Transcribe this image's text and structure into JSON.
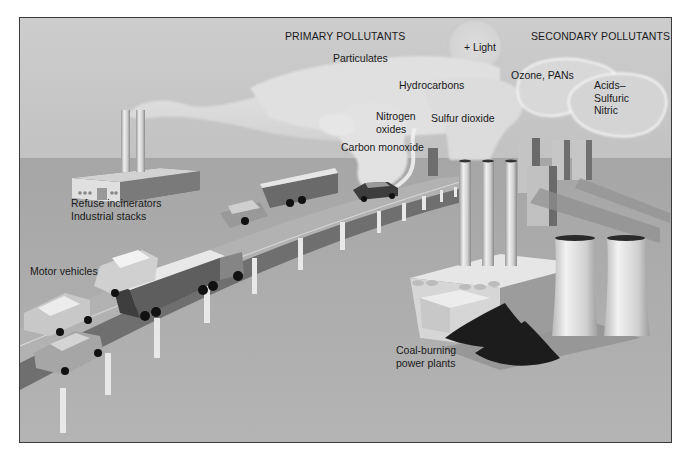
{
  "figure": {
    "type": "illustration",
    "colors": {
      "sky": "#c8c8c8",
      "ground": "#a9a9a9",
      "cloud": "#e2e2e2",
      "road": "#8e8e8e",
      "coal": "#1c1c1c",
      "frame_border": "#3a3a3a"
    }
  },
  "headings": {
    "primary": "PRIMARY POLLUTANTS",
    "secondary": "SECONDARY POLLUTANTS"
  },
  "pollutants": {
    "light": "+ Light",
    "particulates": "Particulates",
    "hydrocarbons": "Hydrocarbons",
    "nitrogen_oxides": "Nitrogen\noxides",
    "sulfur_dioxide": "Sulfur dioxide",
    "carbon_monoxide": "Carbon monoxide",
    "ozone_pans": "Ozone, PANs",
    "acids": "Acids–\nSulfuric\nNitric"
  },
  "sources": {
    "industrial": "Refuse incinerators\nIndustrial stacks",
    "vehicles": "Motor vehicles",
    "power_plants": "Coal-burning\npower plants"
  }
}
